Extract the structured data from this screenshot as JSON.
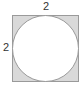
{
  "figure": {
    "shape": "square with inscribed circle",
    "top_side_label": "2",
    "left_side_label": "2",
    "shaded_region": "square minus circle",
    "colors": {
      "shade": "#d8d8d8",
      "stroke": "#9a9a9a",
      "circle_fill": "#ffffff"
    }
  }
}
